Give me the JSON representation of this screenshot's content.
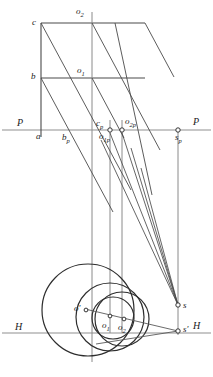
{
  "figure": {
    "background_color": "#ffffff",
    "line_color": "#3a3a3a",
    "ground_line_color": "#8a8a8a",
    "width": 213,
    "height": 377
  },
  "labels": {
    "p_left": "P",
    "p_right": "P",
    "h_left": "H",
    "h_right": "H",
    "c": "c",
    "b": "b",
    "a": "a",
    "o2_top": "o",
    "o2_top_sub": "2",
    "o1_mid": "o",
    "o1_mid_sub": "1",
    "b_p": "b",
    "b_p_sub": "p",
    "c_p": "c",
    "c_p_sub": "p",
    "o1_p": "o",
    "o1_p_sub": "1p",
    "o2_p": "o",
    "o2_p_sub": "2p",
    "s_p": "s",
    "s_p_sub": "p",
    "s": "s",
    "s_prime": "s'",
    "o_prime": "o'",
    "o1_low": "o",
    "o1_low_sub": "1",
    "o2_low": "o",
    "o2_low_sub": "2"
  },
  "geometry": {
    "ground_lines": [
      {
        "name": "P",
        "y": 130,
        "x1": 2,
        "x2": 211
      },
      {
        "name": "H",
        "y": 333,
        "x1": 2,
        "x2": 211
      }
    ],
    "horizontal_levels": [
      {
        "name": "c-level",
        "y": 23,
        "x1": 41,
        "x2": 145
      },
      {
        "name": "b-level",
        "y": 78,
        "x1": 41,
        "x2": 145
      }
    ],
    "vertical_lines": [
      {
        "name": "a-c-vertical",
        "x": 41,
        "y1": 23,
        "y2": 137
      },
      {
        "name": "o-axis-vertical",
        "x": 92,
        "y1": 12,
        "y2": 360
      },
      {
        "name": "o1p-vertical",
        "x": 110,
        "y1": 120,
        "y2": 333
      },
      {
        "name": "o2p-vertical",
        "x": 122,
        "y1": 120,
        "y2": 333
      },
      {
        "name": "s-vertical",
        "x": 178,
        "y1": 128,
        "y2": 335
      }
    ],
    "points": [
      {
        "name": "c",
        "x": 41,
        "y": 23
      },
      {
        "name": "b",
        "x": 41,
        "y": 78
      },
      {
        "name": "a",
        "x": 41,
        "y": 130
      },
      {
        "name": "o2",
        "x": 92,
        "y": 23
      },
      {
        "name": "o1",
        "x": 92,
        "y": 78
      },
      {
        "name": "cp",
        "x": 110,
        "y": 130
      },
      {
        "name": "o1p",
        "x": 110,
        "y": 130
      },
      {
        "name": "o2p",
        "x": 122,
        "y": 130
      },
      {
        "name": "sp",
        "x": 178,
        "y": 130
      },
      {
        "name": "s",
        "x": 178,
        "y": 305
      },
      {
        "name": "s_prime",
        "x": 178,
        "y": 331
      },
      {
        "name": "o_prime",
        "x": 88,
        "y": 310
      },
      {
        "name": "o1_low",
        "x": 110,
        "y": 320
      },
      {
        "name": "o2_low",
        "x": 122,
        "y": 322
      }
    ],
    "ray_lines": [
      {
        "from": [
          41,
          23
        ],
        "to": [
          122,
          175
        ]
      },
      {
        "from": [
          41,
          78
        ],
        "to": [
          110,
          203
        ]
      },
      {
        "from": [
          92,
          23
        ],
        "to": [
          150,
          175
        ]
      },
      {
        "from": [
          92,
          78
        ],
        "to": [
          138,
          180
        ]
      },
      {
        "from": [
          145,
          23
        ],
        "to": [
          178,
          160
        ]
      }
    ],
    "convergent_rays_apex": [
      178,
      305
    ],
    "circles": [
      {
        "name": "big-circle",
        "cx": 88,
        "cy": 310,
        "r": 46
      },
      {
        "name": "mid-circle",
        "cx": 110,
        "cy": 318,
        "r": 33
      },
      {
        "name": "small-circle",
        "cx": 122,
        "cy": 320,
        "r": 26
      },
      {
        "name": "inner-circle",
        "cx": 112,
        "cy": 318,
        "r": 22
      }
    ]
  }
}
